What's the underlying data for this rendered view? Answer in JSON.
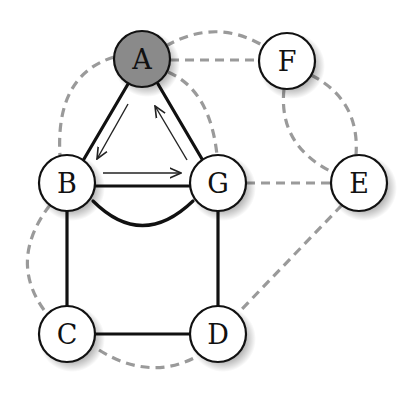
{
  "diagram": {
    "type": "graph",
    "nodes": [
      {
        "id": "A",
        "label": "A",
        "x": 142,
        "y": 59,
        "fill": "#8a8a8a",
        "highlighted": true
      },
      {
        "id": "F",
        "label": "F",
        "x": 287,
        "y": 61,
        "fill": "#ffffff"
      },
      {
        "id": "B",
        "label": "B",
        "x": 67,
        "y": 183,
        "fill": "#ffffff"
      },
      {
        "id": "G",
        "label": "G",
        "x": 218,
        "y": 183,
        "fill": "#ffffff"
      },
      {
        "id": "E",
        "label": "E",
        "x": 359,
        "y": 183,
        "fill": "#ffffff"
      },
      {
        "id": "C",
        "label": "C",
        "x": 67,
        "y": 334,
        "fill": "#ffffff"
      },
      {
        "id": "D",
        "label": "D",
        "x": 218,
        "y": 334,
        "fill": "#ffffff"
      }
    ],
    "solid_edges": [
      [
        "A",
        "B"
      ],
      [
        "A",
        "G"
      ],
      [
        "B",
        "G"
      ],
      [
        "B",
        "G (curved)"
      ],
      [
        "B",
        "C"
      ],
      [
        "G",
        "D"
      ],
      [
        "C",
        "D"
      ]
    ],
    "dashed_edges": [
      [
        "A",
        "F"
      ],
      [
        "A",
        "F (curved)"
      ],
      [
        "A",
        "G (curved)"
      ],
      [
        "A",
        "B (curved)"
      ],
      [
        "F",
        "E (curved)"
      ],
      [
        "F",
        "E (curved, inner)"
      ],
      [
        "G",
        "E"
      ],
      [
        "E",
        "D"
      ],
      [
        "B",
        "C (curved)"
      ],
      [
        "C",
        "D (curved)"
      ]
    ],
    "arrows": [
      {
        "from": "A",
        "to": "B"
      },
      {
        "from": "B",
        "to": "G"
      },
      {
        "from": "G",
        "to": "A"
      }
    ],
    "colors": {
      "solid_edge": "#111111",
      "dashed_edge": "#9a9a9a",
      "highlight_node": "#8a8a8a",
      "node_stroke": "#111111"
    }
  }
}
